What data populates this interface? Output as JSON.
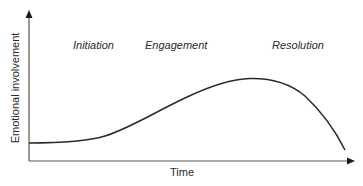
{
  "diagram": {
    "type": "curve-diagram",
    "y_axis_label": "Emotional involvement",
    "x_axis_label": "Time",
    "phases": [
      {
        "label": "Initiation"
      },
      {
        "label": "Engagement"
      },
      {
        "label": "Resolution"
      }
    ],
    "colors": {
      "curve": "#2b2b2b",
      "axis": "#555555",
      "text": "#2b2b2b"
    }
  }
}
